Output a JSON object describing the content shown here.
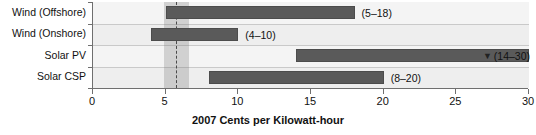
{
  "chart_data": {
    "type": "bar",
    "orientation": "horizontal",
    "title": "",
    "xlabel": "2007 Cents per Kilowatt-hour",
    "ylabel": "",
    "xlim": [
      0,
      30
    ],
    "xticks": [
      0,
      5,
      10,
      15,
      20,
      25,
      30
    ],
    "xtick_labels": [
      "0",
      "5",
      "10",
      "15",
      "20",
      "25",
      "30"
    ],
    "grid": false,
    "legend": "none",
    "categories": [
      "Wind (Offshore)",
      "Wind (Onshore)",
      "Solar PV",
      "Solar CSP"
    ],
    "bars": [
      {
        "category": "Wind (Offshore)",
        "low": 5,
        "high": 18,
        "label": "(5–18)",
        "label_side": "right",
        "marker": "",
        "clipped": false
      },
      {
        "category": "Wind (Onshore)",
        "low": 4,
        "high": 10,
        "label": "(4–10)",
        "label_side": "right",
        "marker": "",
        "clipped": false
      },
      {
        "category": "Solar PV",
        "low": 14,
        "high": 30,
        "label": "(14–30)",
        "label_side": "right-edge",
        "marker": "▼",
        "clipped": true
      },
      {
        "category": "Solar CSP",
        "low": 8,
        "high": 20,
        "label": "(8–20)",
        "label_side": "right",
        "marker": "",
        "clipped": false
      }
    ],
    "reference_band": {
      "low": 4.9,
      "high": 6.6,
      "dashed_line": 5.7
    },
    "colors": {
      "bar_fill": "#5a5a5a",
      "bar_edge": "#4c4c4c",
      "plot_background": "#f2f2f2",
      "band_shade": "#b8b8b8",
      "axis": "#6f6f6f",
      "text": "#111111"
    }
  }
}
